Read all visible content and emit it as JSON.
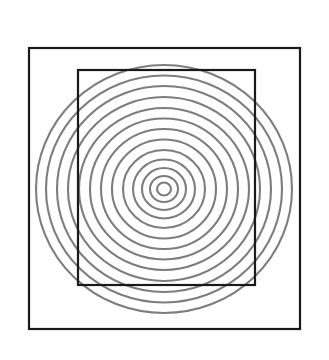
{
  "figure": {
    "background_color": "#ffffff",
    "canvas": {
      "width": 329,
      "height": 360
    }
  },
  "outer_square": {
    "name": "outer-square",
    "x": 29,
    "y": 48,
    "width": 271,
    "height": 281,
    "stroke_color": "#1a1a1a",
    "stroke_width": 2.2
  },
  "inner_rectangle": {
    "name": "inner-rectangle",
    "x": 78,
    "y": 70,
    "width": 177,
    "height": 215,
    "stroke_color": "#1a1a1a",
    "stroke_width": 2.2
  },
  "concentric_circles": {
    "name": "concentric-rings",
    "center_x": 164,
    "center_y": 189,
    "stroke_color": "#7d7d7d",
    "stroke_width": 2.1,
    "count": 13,
    "radii_x": [
      7,
      14,
      22,
      31,
      41,
      52,
      63,
      74,
      85,
      96,
      107,
      118,
      128
    ],
    "radii_y": [
      6.5,
      13,
      21,
      29.5,
      39,
      49.5,
      60,
      70.5,
      81,
      92,
      103,
      113.5,
      124
    ]
  },
  "chart_data": {
    "type": "scatter",
    "xlabel": "",
    "ylabel": "",
    "grid": false,
    "legend": "none",
    "xlim": [
      0,
      329
    ],
    "ylim": [
      0,
      360
    ],
    "series": [
      {
        "name": "concentric rings",
        "kind": "ellipse-rings",
        "center": [
          164,
          189
        ],
        "radii_x": [
          7,
          14,
          22,
          31,
          41,
          52,
          63,
          74,
          85,
          96,
          107,
          118,
          128
        ],
        "radii_y": [
          6.5,
          13,
          21,
          29.5,
          39,
          49.5,
          60,
          70.5,
          81,
          92,
          103,
          113.5,
          124
        ],
        "color": "#7d7d7d"
      },
      {
        "name": "outer square",
        "kind": "rect",
        "x": 29,
        "y": 48,
        "width": 271,
        "height": 281,
        "color": "#1a1a1a"
      },
      {
        "name": "inner rectangle",
        "kind": "rect",
        "x": 78,
        "y": 70,
        "width": 177,
        "height": 215,
        "color": "#1a1a1a"
      }
    ]
  }
}
